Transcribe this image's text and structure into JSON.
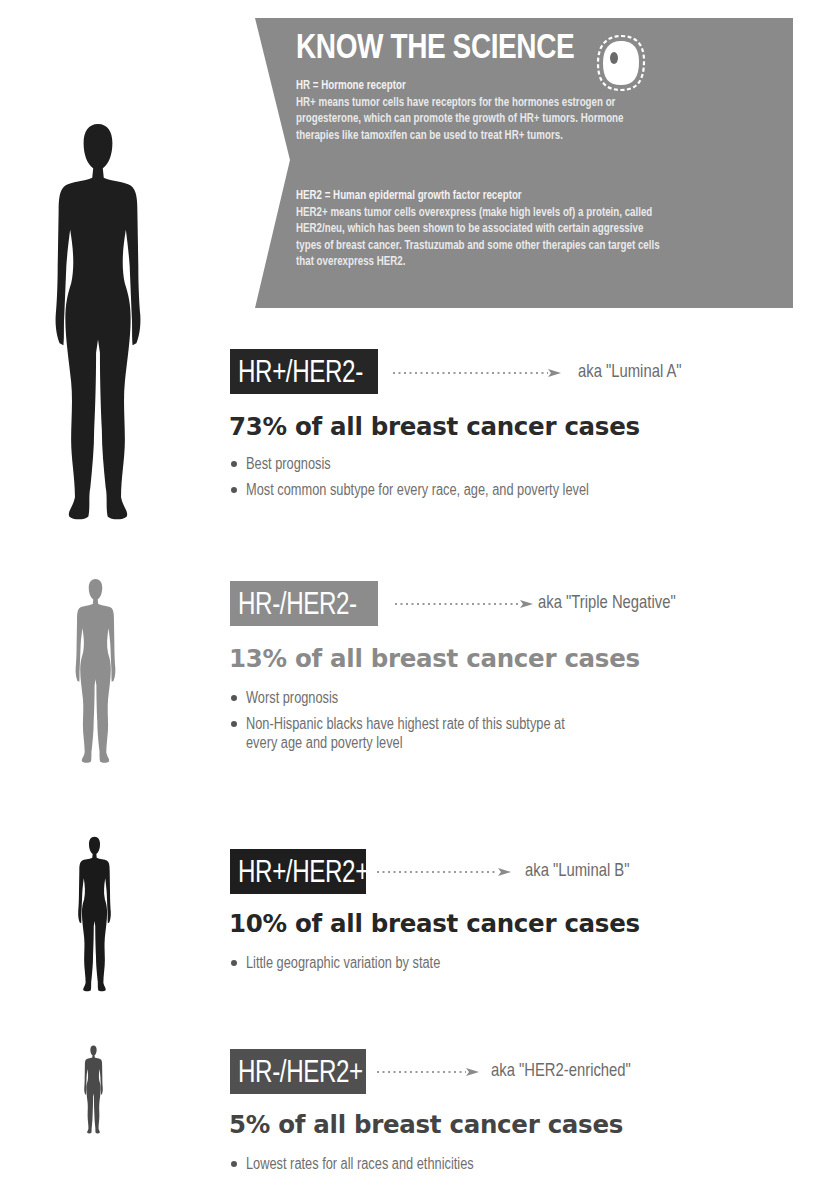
{
  "banner": {
    "title": "KNOW THE SCIENCE",
    "icon": "cell-icon",
    "background_color": "#8a8a8a",
    "definitions": [
      {
        "term": "HR = Hormone receptor",
        "lines": [
          "HR+ means tumor cells have receptors for the hormones estrogen or",
          "progesterone, which can promote the growth of HR+ tumors. Hormone",
          "therapies like tamoxifen can be used to treat HR+ tumors."
        ]
      },
      {
        "term": "HER2 = Human epidermal growth factor receptor",
        "lines": [
          "HER2+ means tumor cells overexpress (make high levels of) a protein, called",
          "HER2/neu, which has been shown to be associated with certain aggressive",
          "types of breast cancer. Trastuzumab and some other therapies can target cells",
          "that overexpress HER2."
        ]
      }
    ]
  },
  "subtypes": [
    {
      "label": "HR+/HER2-",
      "aka": "aka \"Luminal A\"",
      "percent_text": "73% of all breast cancer cases",
      "percent": 73,
      "label_color": "#262626",
      "percent_color": "#2a2a2a",
      "silhouette_color": "#1e1e1e",
      "bullets": [
        "Best prognosis",
        "Most common subtype for every race, age, and poverty level"
      ]
    },
    {
      "label": "HR-/HER2-",
      "aka": "aka \"Triple Negative\"",
      "percent_text": "13% of all breast cancer cases",
      "percent": 13,
      "label_color": "#8c8c8c",
      "percent_color": "#8a8a8a",
      "silhouette_color": "#8e8e8e",
      "bullets": [
        "Worst prognosis",
        "Non-Hispanic blacks have highest rate of this subtype at",
        "every age and poverty level"
      ]
    },
    {
      "label": "HR+/HER2+",
      "aka": "aka \"Luminal B\"",
      "percent_text": "10% of all breast cancer cases",
      "percent": 10,
      "label_color": "#1e1e1e",
      "percent_color": "#262626",
      "silhouette_color": "#1a1a1a",
      "bullets": [
        "Little geographic variation by state"
      ]
    },
    {
      "label": "HR-/HER2+",
      "aka": "aka \"HER2-enriched\"",
      "percent_text": "5% of all breast cancer cases",
      "percent": 5,
      "label_color": "#505050",
      "percent_color": "#444444",
      "silhouette_color": "#4a4a4a",
      "bullets": [
        "Lowest rates for all races and ethnicities"
      ]
    }
  ]
}
